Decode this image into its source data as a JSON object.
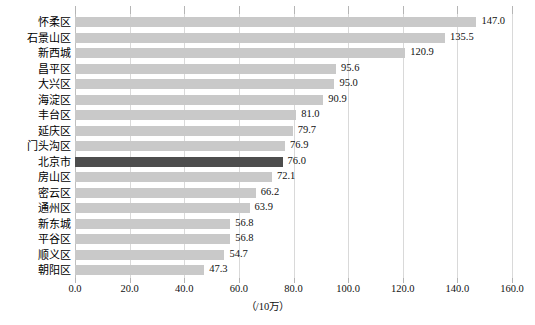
{
  "chart_data": {
    "type": "bar",
    "orientation": "horizontal",
    "title": "",
    "xlabel": "（/10万）",
    "ylabel": "",
    "xlim": [
      0,
      160
    ],
    "xticks": [
      "0.0",
      "20.0",
      "40.0",
      "60.0",
      "80.0",
      "100.0",
      "120.0",
      "140.0",
      "160.0"
    ],
    "xtick_values": [
      0,
      20,
      40,
      60,
      80,
      100,
      120,
      140,
      160
    ],
    "grid": true,
    "legend": "none",
    "categories": [
      "怀柔区",
      "石景山区",
      "新西城",
      "昌平区",
      "大兴区",
      "海淀区",
      "丰台区",
      "延庆区",
      "门头沟区",
      "北京市",
      "房山区",
      "密云区",
      "通州区",
      "新东城",
      "平谷区",
      "顺义区",
      "朝阳区"
    ],
    "values": [
      147.0,
      135.5,
      120.9,
      95.6,
      95.0,
      90.9,
      81.0,
      79.7,
      76.9,
      76.0,
      72.1,
      66.2,
      63.9,
      56.8,
      56.8,
      54.7,
      47.3
    ],
    "value_labels": [
      "147.0",
      "135.5",
      "120.9",
      "95.6",
      "95.0",
      "90.9",
      "81.0",
      "79.7",
      "76.9",
      "76.0",
      "72.1",
      "66.2",
      "63.9",
      "56.8",
      "56.8",
      "54.7",
      "47.3"
    ],
    "highlight_category": "北京市",
    "colors": {
      "bar": "#c9c9c9",
      "bar_highlight": "#4d4d4d",
      "gridline": "#d9d9d9",
      "axis": "#bfbfbf",
      "text": "#111111"
    }
  }
}
